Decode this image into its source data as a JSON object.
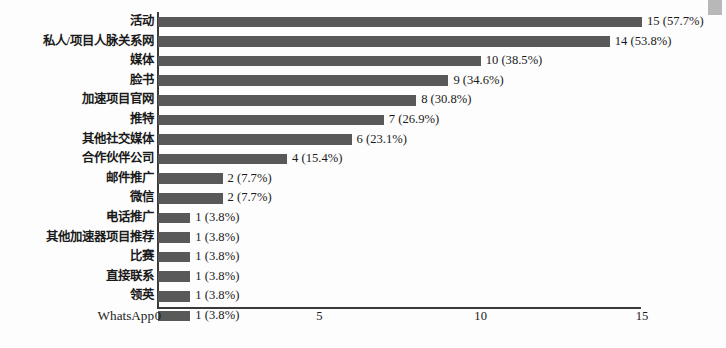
{
  "chart_data": {
    "type": "bar",
    "orientation": "horizontal",
    "title": "",
    "xlabel": "",
    "ylabel": "",
    "xlim": [
      0,
      15
    ],
    "xticks": [
      0,
      5,
      10,
      15
    ],
    "xtick_labels": [
      "0",
      "5",
      "10",
      "15"
    ],
    "grid": false,
    "legend": false,
    "bar_color": "#595959",
    "axis_color": "#3a3a3a",
    "total_respondents": 26,
    "categories": [
      "活动",
      "私人/项目人脉关系网",
      "媒体",
      "脸书",
      "加速项目官网",
      "推特",
      "其他社交媒体",
      "合作伙伴公司",
      "邮件推广",
      "微信",
      "电话推广",
      "其他加速器项目推荐",
      "比赛",
      "直接联系",
      "领英",
      "WhatsApp"
    ],
    "values": [
      15,
      14,
      10,
      9,
      8,
      7,
      6,
      4,
      2,
      2,
      1,
      1,
      1,
      1,
      1,
      1
    ],
    "percents": [
      57.7,
      53.8,
      38.5,
      34.6,
      30.8,
      26.9,
      23.1,
      15.4,
      7.7,
      7.7,
      3.8,
      3.8,
      3.8,
      3.8,
      3.8,
      3.8
    ],
    "data_labels": [
      "15 (57.7%)",
      "14 (53.8%)",
      "10 (38.5%)",
      "9 (34.6%)",
      "8 (30.8%)",
      "7 (26.9%)",
      "6 (23.1%)",
      "4 (15.4%)",
      "2 (7.7%)",
      "2 (7.7%)",
      "1 (3.8%)",
      "1 (3.8%)",
      "1 (3.8%)",
      "1 (3.8%)",
      "1 (3.8%)",
      "1 (3.8%)"
    ],
    "label_scripts": [
      "cjk",
      "cjk",
      "cjk",
      "cjk",
      "cjk",
      "cjk",
      "cjk",
      "cjk",
      "cjk",
      "cjk",
      "cjk",
      "cjk",
      "cjk",
      "cjk",
      "cjk",
      "latin"
    ]
  }
}
